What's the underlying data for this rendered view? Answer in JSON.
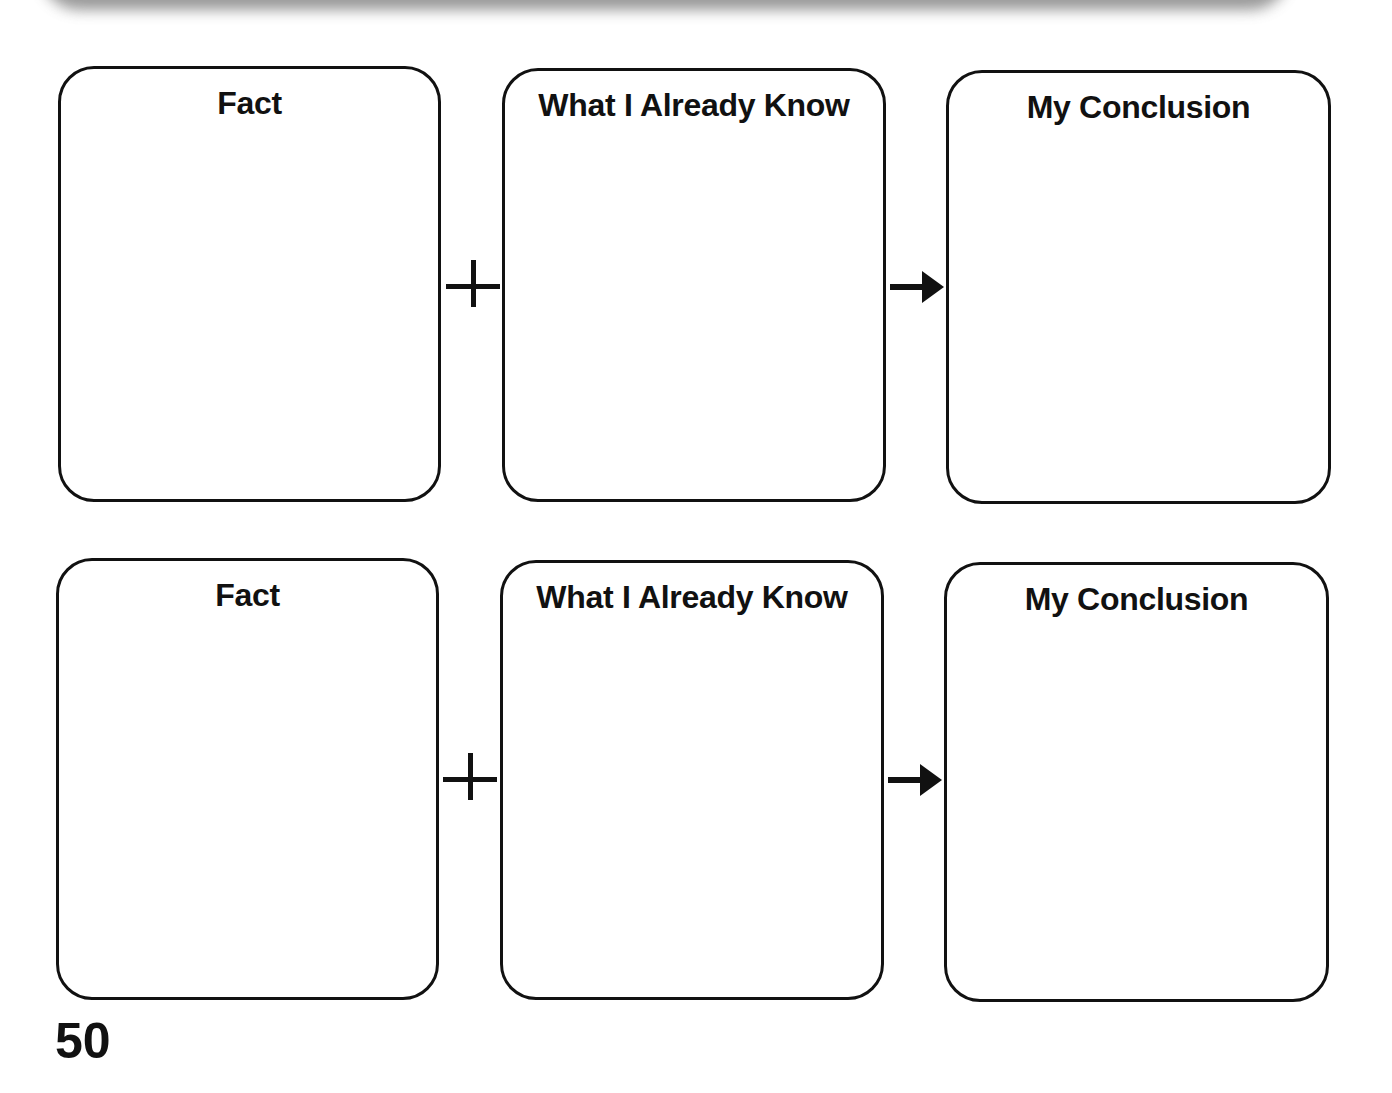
{
  "worksheet": {
    "rows": [
      {
        "boxes": [
          {
            "title": "Fact"
          },
          {
            "title": "What I Already Know"
          },
          {
            "title": "My Conclusion"
          }
        ],
        "connectors": [
          "plus",
          "arrow"
        ]
      },
      {
        "boxes": [
          {
            "title": "Fact"
          },
          {
            "title": "What I Already Know"
          },
          {
            "title": "My Conclusion"
          }
        ],
        "connectors": [
          "plus",
          "arrow"
        ]
      }
    ],
    "page_number": "50"
  }
}
